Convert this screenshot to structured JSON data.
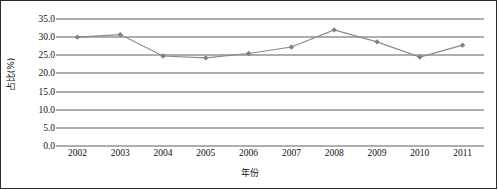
{
  "chart_data": {
    "type": "line",
    "title": "",
    "xlabel": "年份",
    "ylabel": "占比(%)",
    "categories": [
      "2002",
      "2003",
      "2004",
      "2005",
      "2006",
      "2007",
      "2008",
      "2009",
      "2010",
      "2011"
    ],
    "values": [
      30.0,
      30.7,
      24.8,
      24.3,
      25.5,
      27.3,
      32.0,
      28.7,
      24.5,
      27.8
    ],
    "series": [
      {
        "name": "占比(%)",
        "values": [
          30.0,
          30.7,
          24.8,
          24.3,
          25.5,
          27.3,
          32.0,
          28.7,
          24.5,
          27.8
        ]
      }
    ],
    "ylim": [
      0.0,
      35.0
    ],
    "ytick_step": 5.0,
    "ytick_labels": [
      "35.0",
      "30.0",
      "25.0",
      "20.0",
      "15.0",
      "10.0",
      "5.0",
      "0.0"
    ],
    "ytick_values": [
      35.0,
      30.0,
      25.0,
      20.0,
      15.0,
      10.0,
      5.0,
      0.0
    ],
    "grid": true,
    "grid_axis": "y",
    "legend": false,
    "legend_position": "none",
    "marker": "diamond",
    "colors": {
      "series_line": "#8a8a8e",
      "series_marker": "#7e7e84",
      "gridline": "#5f5f5f",
      "frame": "#2b2b2b",
      "text": "#111111",
      "background": "#ffffff"
    }
  }
}
